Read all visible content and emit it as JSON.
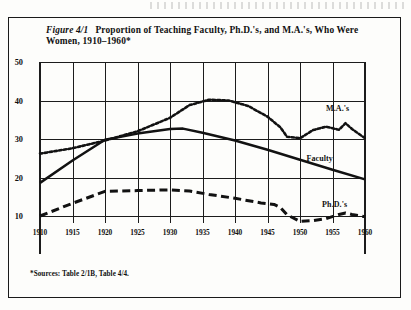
{
  "figure": {
    "number": "Figure 4/1",
    "title": "Proportion of Teaching Faculty, Ph.D.'s, and M.A.'s, Who Were Women, 1910–1960*",
    "footnote": "*Sources: Table 2/1B, Table 4/4."
  },
  "labels": {
    "ma": "M.A.'s",
    "faculty": "Faculty",
    "phd": "Ph.D.'s"
  },
  "chart_data": {
    "type": "line",
    "title": "Proportion of Teaching Faculty, Ph.D.'s, and M.A.'s, Who Were Women, 1910–1960*",
    "xlabel": "",
    "ylabel": "",
    "xlim": [
      1910,
      1960
    ],
    "ylim": [
      5,
      50
    ],
    "yticks": [
      10,
      20,
      30,
      40,
      50
    ],
    "xticks": [
      1910,
      1915,
      1920,
      1925,
      1930,
      1935,
      1940,
      1945,
      1950,
      1955,
      1960
    ],
    "grid": true,
    "legend_position": "inline-right",
    "series": [
      {
        "name": "M.A.'s",
        "style": "dotted",
        "points": [
          [
            1910,
            26.2
          ],
          [
            1915,
            27.6
          ],
          [
            1920,
            29.6
          ],
          [
            1925,
            32.0
          ],
          [
            1930,
            35.5
          ],
          [
            1933,
            38.8
          ],
          [
            1936,
            40.2
          ],
          [
            1939,
            40.0
          ],
          [
            1942,
            38.6
          ],
          [
            1945,
            35.8
          ],
          [
            1947,
            33.0
          ],
          [
            1948,
            30.6
          ],
          [
            1950,
            30.2
          ],
          [
            1952,
            32.3
          ],
          [
            1954,
            33.2
          ],
          [
            1956,
            32.4
          ],
          [
            1957,
            34.1
          ],
          [
            1958,
            32.6
          ],
          [
            1960,
            30.2
          ]
        ]
      },
      {
        "name": "Faculty",
        "style": "solid",
        "points": [
          [
            1910,
            18.6
          ],
          [
            1915,
            24.4
          ],
          [
            1920,
            29.8
          ],
          [
            1925,
            31.4
          ],
          [
            1930,
            32.6
          ],
          [
            1932,
            32.7
          ],
          [
            1935,
            31.6
          ],
          [
            1940,
            29.6
          ],
          [
            1945,
            27.2
          ],
          [
            1950,
            24.6
          ],
          [
            1955,
            22.0
          ],
          [
            1960,
            19.5
          ]
        ]
      },
      {
        "name": "Ph.D.'s",
        "style": "dashed",
        "points": [
          [
            1910,
            10.0
          ],
          [
            1915,
            13.3
          ],
          [
            1920,
            16.4
          ],
          [
            1925,
            16.6
          ],
          [
            1930,
            16.8
          ],
          [
            1933,
            16.5
          ],
          [
            1936,
            15.6
          ],
          [
            1940,
            14.6
          ],
          [
            1944,
            13.4
          ],
          [
            1946,
            13.0
          ],
          [
            1947,
            12.2
          ],
          [
            1948,
            10.3
          ],
          [
            1950,
            8.6
          ],
          [
            1952,
            8.8
          ],
          [
            1954,
            9.3
          ],
          [
            1956,
            10.4
          ],
          [
            1957,
            10.8
          ],
          [
            1958,
            10.4
          ],
          [
            1960,
            9.8
          ]
        ]
      }
    ]
  }
}
